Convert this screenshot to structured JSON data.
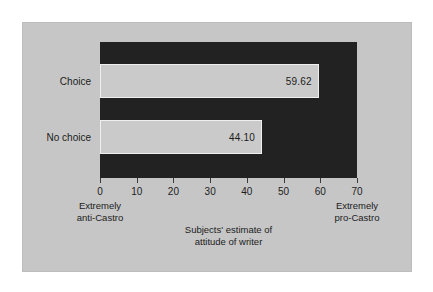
{
  "chart_data": {
    "type": "bar",
    "orientation": "horizontal",
    "title": "",
    "categories": [
      "Choice",
      "No choice"
    ],
    "values": [
      59.62,
      44.1
    ],
    "value_labels": [
      "59.62",
      "44.10"
    ],
    "xlabel_lines": [
      "Subjects' estimate of",
      "attitude of writer"
    ],
    "ylabel": "",
    "xlim": [
      0,
      70
    ],
    "xticks": [
      0,
      10,
      20,
      30,
      40,
      50,
      60,
      70
    ],
    "xtick_labels": [
      "0",
      "10",
      "20",
      "30",
      "40",
      "50",
      "60",
      "70"
    ],
    "axis_anchors": [
      {
        "at": 0,
        "lines": [
          "Extremely",
          "anti-Castro"
        ]
      },
      {
        "at": 70,
        "lines": [
          "Extremely",
          "pro-Castro"
        ]
      }
    ],
    "grid": false,
    "legend": null,
    "colors": {
      "page_background": "#ffffff",
      "figure_background": "#c6c6c6",
      "plot_background": "#222222",
      "bar_fill": "#cacaca",
      "bar_edge": "#efefef",
      "text": "#1c1c1c"
    }
  }
}
